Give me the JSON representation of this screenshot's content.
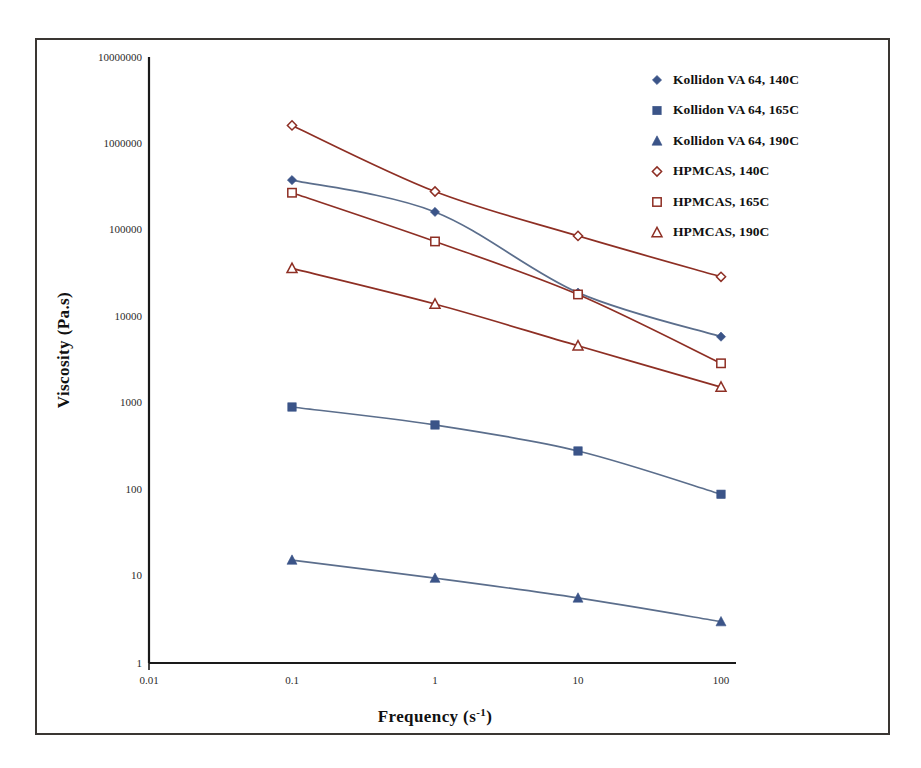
{
  "chart_data": {
    "type": "line",
    "title": "",
    "xlabel": "Frequency (s-1)",
    "xlabel_base": "Frequency (s",
    "xlabel_sup": "-1",
    "xlabel_tail": ")",
    "ylabel": "Viscosity (Pa.s)",
    "xscale": "log",
    "yscale": "log",
    "xlim": [
      0.01,
      100
    ],
    "ylim": [
      1,
      10000000
    ],
    "grid": false,
    "legend_position": "top-right",
    "x_ticks": [
      "0.01",
      "0.1",
      "1",
      "10",
      "100"
    ],
    "x_tick_values": [
      0.01,
      0.1,
      1,
      10,
      100
    ],
    "y_ticks": [
      "1",
      "10",
      "100",
      "1000",
      "10000",
      "100000",
      "1000000",
      "10000000"
    ],
    "y_tick_values": [
      1,
      10,
      100,
      1000,
      10000,
      100000,
      1000000,
      10000000
    ],
    "x": [
      0.1,
      1,
      10,
      100
    ],
    "series": [
      {
        "name": "Kollidon VA 64, 140C",
        "marker": "diamond-filled",
        "marker_color": "#3b5488",
        "line_color": "#5b6e8c",
        "values": [
          420000,
          180000,
          21000,
          6500
        ]
      },
      {
        "name": "Kollidon VA 64, 165C",
        "marker": "square-filled",
        "marker_color": "#3b5488",
        "line_color": "#5b6e8c",
        "values": [
          1000,
          620,
          310,
          98
        ]
      },
      {
        "name": "Kollidon VA 64, 190C",
        "marker": "triangle-filled",
        "marker_color": "#3b5488",
        "line_color": "#5b6e8c",
        "values": [
          17,
          10.5,
          6.2,
          3.3
        ]
      },
      {
        "name": "HPMCAS, 140C",
        "marker": "diamond-open",
        "marker_color": "#8e2f24",
        "line_color": "#8e2f24",
        "values": [
          1800000,
          310000,
          95000,
          32000
        ]
      },
      {
        "name": "HPMCAS, 165C",
        "marker": "square-open",
        "marker_color": "#8e2f24",
        "line_color": "#8e2f24",
        "values": [
          300000,
          82000,
          20000,
          3200
        ]
      },
      {
        "name": "HPMCAS, 190C",
        "marker": "triangle-open",
        "marker_color": "#8e2f24",
        "line_color": "#8e2f24",
        "values": [
          40000,
          15500,
          5100,
          1700
        ]
      }
    ]
  },
  "colors": {
    "kollidon_marker": "#3b5488",
    "kollidon_line": "#5b6e8c",
    "hpmcas_marker": "#8e2f24",
    "hpmcas_line": "#8e2f24",
    "axis": "#1a1a1a",
    "frame": "#3a3633",
    "background": "#ffffff"
  }
}
